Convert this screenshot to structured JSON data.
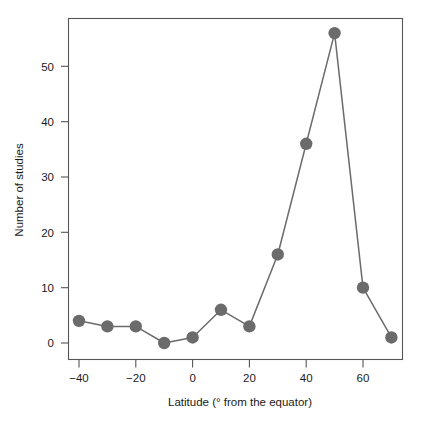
{
  "chart_data": {
    "type": "line",
    "title": "",
    "subtitle": "",
    "xlabel": "Latitude  (° from the equator)",
    "ylabel": "Number of studies",
    "x": [
      -40,
      -30,
      -20,
      -10,
      0,
      10,
      20,
      30,
      40,
      50,
      60,
      70
    ],
    "values": [
      4,
      3,
      3,
      0,
      1,
      6,
      3,
      16,
      36,
      56,
      10,
      1
    ],
    "series": [
      {
        "name": "Number of studies",
        "values": [
          4,
          3,
          3,
          0,
          1,
          6,
          3,
          16,
          36,
          56,
          10,
          1
        ]
      }
    ],
    "xlim": [
      -47,
      77
    ],
    "ylim": [
      -3,
      59
    ],
    "xticks": [
      -40,
      -20,
      0,
      20,
      40,
      60
    ],
    "xtick_labels": [
      "−40",
      "−20",
      "0",
      "20",
      "40",
      "60"
    ],
    "yticks": [
      0,
      10,
      20,
      30,
      40,
      50
    ],
    "ytick_labels": [
      "0",
      "10",
      "20",
      "30",
      "40",
      "50"
    ],
    "grid": false,
    "legend": false,
    "legend_position": "none",
    "marker": "filled-circle",
    "marker_color": "#6b6b6b",
    "line_color": "#6b6b6b",
    "frame_color": "#555555",
    "background_color": "#ffffff",
    "annotations": []
  },
  "figure": {
    "caption": ""
  }
}
